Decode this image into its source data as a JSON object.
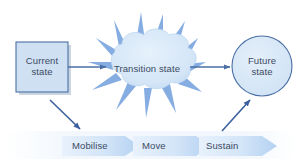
{
  "diagram": {
    "background_color": "#ffffff",
    "text_color": "#3b4a63",
    "nodes": [
      {
        "id": "current-state",
        "shape": "rectangle",
        "label": "Current\nstate",
        "label_line1": "Current",
        "label_line2": "state",
        "fill": "#cfe0f2",
        "stroke": "#4a6fa5",
        "shadow": "#b9c6d6"
      },
      {
        "id": "transition-state",
        "shape": "spiky-cloud",
        "label": "Transition state",
        "fill": "#d6e6f7",
        "spike_fill": "#7ba7e0",
        "stroke": "#b9d2ee"
      },
      {
        "id": "future-state",
        "shape": "circle",
        "label": "Future\nstate",
        "label_line1": "Future",
        "label_line2": "state",
        "fill": "#d6e6f7",
        "stroke": "#4a6fa5"
      }
    ],
    "connectors": [
      {
        "id": "arrow-current-to-transition",
        "type": "arrow",
        "direction": "right",
        "color": "#4a6fa5"
      },
      {
        "id": "arrow-transition-to-future",
        "type": "arrow",
        "direction": "right",
        "color": "#4a6fa5"
      },
      {
        "id": "arrow-current-to-mobilise",
        "type": "arrow",
        "direction": "down-right",
        "color": "#3c5f9e"
      },
      {
        "id": "arrow-sustain-to-future",
        "type": "arrow",
        "direction": "up-right",
        "color": "#3c5f9e"
      }
    ],
    "process_band": {
      "id": "process-chevrons",
      "band_fill": "#f2f7fd",
      "chevrons": [
        {
          "id": "chevron-mobilise",
          "label": "Mobilise",
          "fill_start": "#e4eefb",
          "fill_end": "#b7d3f2"
        },
        {
          "id": "chevron-move",
          "label": "Move",
          "fill_start": "#e4eefb",
          "fill_end": "#b7d3f2"
        },
        {
          "id": "chevron-sustain",
          "label": "Sustain",
          "fill_start": "#e4eefb",
          "fill_end": "#b7d3f2"
        }
      ]
    }
  }
}
